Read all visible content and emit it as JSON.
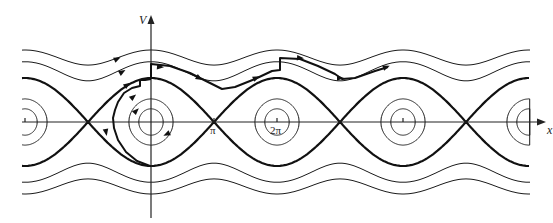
{
  "diagram": {
    "axes": {
      "x_label": "x",
      "y_label": "V",
      "x_ticks": [
        {
          "label": "",
          "value": -2
        },
        {
          "label": "π",
          "value": 1
        },
        {
          "label": "2π",
          "value": 2
        },
        {
          "label": "",
          "value": 4
        }
      ]
    },
    "geometry": {
      "origin_px": [
        151,
        122
      ],
      "pi_px": 63,
      "v_scale_px": 22,
      "x_range_px": [
        22,
        546
      ],
      "curves_clip_px": [
        22,
        530
      ]
    },
    "closed_orbit_energies": [
      -0.82,
      -0.45
    ],
    "separatrix_energy": 1.0,
    "open_orbit_energies": [
      2.75,
      4.35
    ],
    "trajectory_px": [
      [
        151,
        79
      ],
      [
        145,
        80
      ],
      [
        140,
        80
      ],
      [
        140,
        86
      ],
      [
        132,
        88
      ],
      [
        124,
        93
      ],
      [
        118,
        102
      ],
      [
        115,
        110
      ],
      [
        113,
        118
      ],
      [
        114,
        128
      ],
      [
        118,
        140
      ],
      [
        126,
        152
      ],
      [
        137,
        161
      ],
      [
        150,
        166
      ],
      [
        151,
        166
      ]
    ],
    "trajectory_upper_px": [
      [
        151,
        79
      ],
      [
        151,
        64
      ],
      [
        170,
        66
      ],
      [
        190,
        73
      ],
      [
        210,
        83
      ],
      [
        222,
        89
      ],
      [
        235,
        87
      ],
      [
        255,
        79
      ],
      [
        272,
        71
      ],
      [
        280,
        70
      ],
      [
        280,
        58
      ],
      [
        300,
        59
      ],
      [
        318,
        66
      ],
      [
        335,
        74
      ],
      [
        342,
        79
      ],
      [
        355,
        78
      ],
      [
        375,
        71
      ],
      [
        388,
        67
      ]
    ],
    "arrow_marks_px": [
      {
        "x": 117,
        "y": 59,
        "angle": -25
      },
      {
        "x": 122,
        "y": 72,
        "angle": -30
      },
      {
        "x": 127,
        "y": 85,
        "angle": -35
      },
      {
        "x": 133,
        "y": 97,
        "angle": -40
      },
      {
        "x": 136,
        "y": 111,
        "angle": -45
      },
      {
        "x": 167,
        "y": 134,
        "angle": 155
      },
      {
        "x": 160,
        "y": 67,
        "angle": 5
      },
      {
        "x": 199,
        "y": 78,
        "angle": 30
      },
      {
        "x": 256,
        "y": 78,
        "angle": -25
      },
      {
        "x": 300,
        "y": 58,
        "angle": 5
      },
      {
        "x": 340,
        "y": 78,
        "angle": 0
      },
      {
        "x": 386,
        "y": 67,
        "angle": -20
      },
      {
        "x": 106,
        "y": 132,
        "angle": 80
      }
    ],
    "colors": {
      "curve": "#1a1a1a",
      "separatrix": "#111111",
      "background": "#ffffff"
    }
  }
}
